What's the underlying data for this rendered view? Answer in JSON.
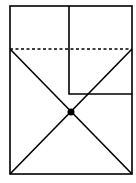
{
  "diagram": {
    "type": "geometric-figure",
    "background": "#ffffff",
    "stroke_color": "#000000",
    "outer_rectangle": {
      "x1": 10,
      "y1": 6,
      "x2": 132,
      "y2": 174
    },
    "inner_rectangle": {
      "x1": 69,
      "y1": 6,
      "x2": 132,
      "y2": 94
    },
    "dashed_line": {
      "x1": 10,
      "y1": 49,
      "x2": 132,
      "y2": 49
    },
    "diagonals": [
      {
        "x1": 10,
        "y1": 49,
        "x2": 132,
        "y2": 174
      },
      {
        "x1": 132,
        "y1": 49,
        "x2": 10,
        "y2": 174
      }
    ],
    "intersection_point": {
      "cx": 71,
      "cy": 112,
      "r": 3.5
    }
  }
}
